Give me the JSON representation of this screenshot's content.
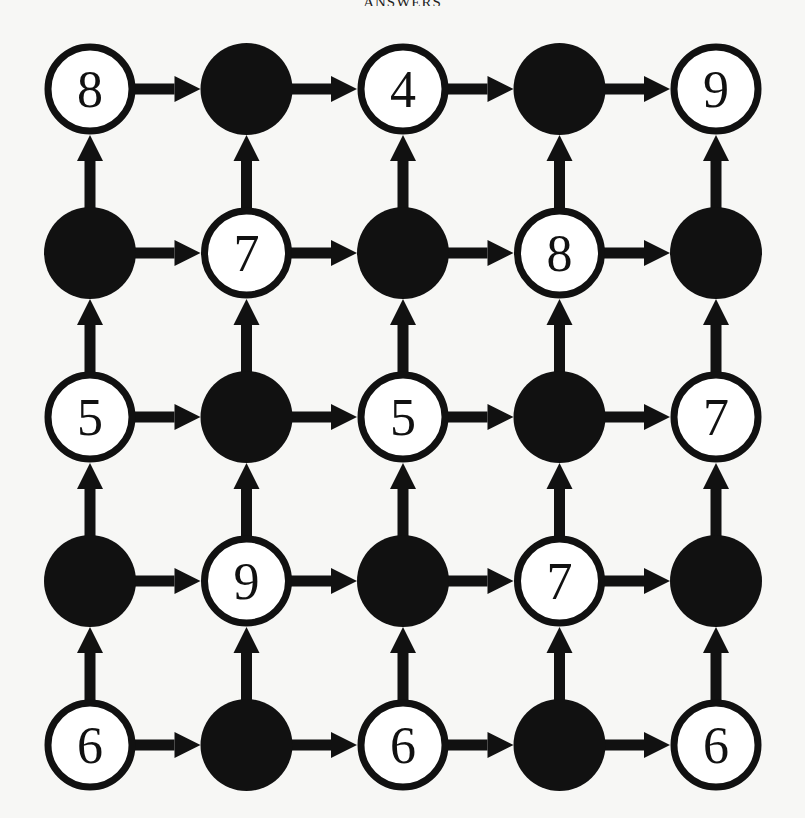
{
  "header": {
    "title": "ANSWERS"
  },
  "colors": {
    "background": "#f7f7f5",
    "ink": "#111111",
    "node_fill_open": "#ffffff"
  },
  "grid": {
    "rows": 5,
    "cols": 5,
    "origin": {
      "x": 90,
      "y": 89
    },
    "spacing": {
      "x": 156.5,
      "y": 164
    },
    "radius": 44,
    "edge_direction": {
      "horizontal": "right",
      "vertical": "up"
    },
    "nodes": [
      [
        {
          "type": "open",
          "label": "8"
        },
        {
          "type": "filled",
          "label": ""
        },
        {
          "type": "open",
          "label": "4"
        },
        {
          "type": "filled",
          "label": ""
        },
        {
          "type": "open",
          "label": "9"
        }
      ],
      [
        {
          "type": "filled",
          "label": ""
        },
        {
          "type": "open",
          "label": "7"
        },
        {
          "type": "filled",
          "label": ""
        },
        {
          "type": "open",
          "label": "8"
        },
        {
          "type": "filled",
          "label": ""
        }
      ],
      [
        {
          "type": "open",
          "label": "5"
        },
        {
          "type": "filled",
          "label": ""
        },
        {
          "type": "open",
          "label": "5"
        },
        {
          "type": "filled",
          "label": ""
        },
        {
          "type": "open",
          "label": "7"
        }
      ],
      [
        {
          "type": "filled",
          "label": ""
        },
        {
          "type": "open",
          "label": "9"
        },
        {
          "type": "filled",
          "label": ""
        },
        {
          "type": "open",
          "label": "7"
        },
        {
          "type": "filled",
          "label": ""
        }
      ],
      [
        {
          "type": "open",
          "label": "6"
        },
        {
          "type": "filled",
          "label": ""
        },
        {
          "type": "open",
          "label": "6"
        },
        {
          "type": "filled",
          "label": ""
        },
        {
          "type": "open",
          "label": "6"
        }
      ]
    ]
  }
}
